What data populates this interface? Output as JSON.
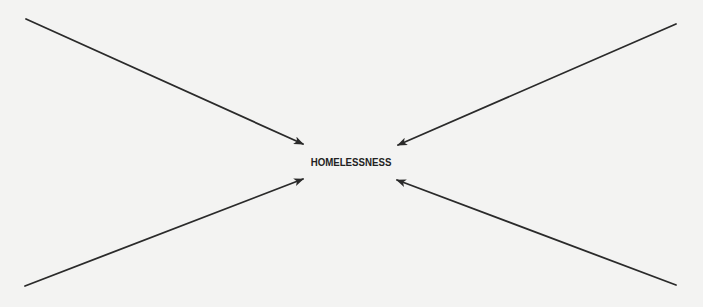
{
  "diagram": {
    "center_label": "HOMELESSNESS",
    "colors": {
      "background": "#f3f3f2",
      "arrow": "#2a2a2a",
      "text": "#222222"
    },
    "arrows": [
      {
        "name": "arrow-top-left",
        "from": [
          26,
          19
        ],
        "to": [
          303,
          144
        ]
      },
      {
        "name": "arrow-top-right",
        "from": [
          676,
          24
        ],
        "to": [
          398,
          145
        ]
      },
      {
        "name": "arrow-bottom-left",
        "from": [
          25,
          286
        ],
        "to": [
          303,
          179
        ]
      },
      {
        "name": "arrow-bottom-right",
        "from": [
          676,
          285
        ],
        "to": [
          397,
          180
        ]
      }
    ]
  }
}
